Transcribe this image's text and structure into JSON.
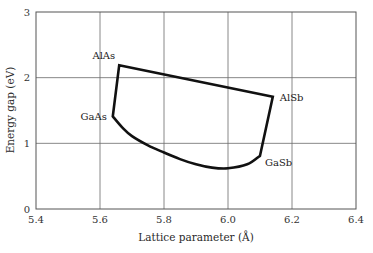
{
  "chart_data": {
    "type": "line",
    "title": "",
    "xlabel": "Lattice parameter (Å)",
    "ylabel": "Energy gap (eV)",
    "xlim": [
      5.4,
      6.4
    ],
    "ylim": [
      0,
      3
    ],
    "grid": true,
    "x_ticks": [
      5.4,
      5.6,
      5.8,
      6.0,
      6.2,
      6.4
    ],
    "x_tick_labels": [
      "5.4",
      "5.6",
      "5.8",
      "6.0",
      "6.2",
      "6.4"
    ],
    "y_ticks": [
      0,
      1,
      2,
      3
    ],
    "y_tick_labels": [
      "0",
      "1",
      "2",
      "3"
    ],
    "points": [
      {
        "name": "AlAs",
        "x": 5.66,
        "y": 2.19,
        "label_dx": -4,
        "label_dy": -6,
        "anchor": "end"
      },
      {
        "name": "AlSb",
        "x": 6.14,
        "y": 1.71,
        "label_dx": 7,
        "label_dy": 4,
        "anchor": "start"
      },
      {
        "name": "GaSb",
        "x": 6.1,
        "y": 0.81,
        "label_dx": 5,
        "label_dy": 10,
        "anchor": "start"
      },
      {
        "name": "GaAs",
        "x": 5.64,
        "y": 1.41,
        "label_dx": -6,
        "label_dy": 4,
        "anchor": "end"
      }
    ],
    "series": [
      {
        "name": "AlAs-AlSb",
        "type": "line",
        "x": [
          5.66,
          6.14
        ],
        "y": [
          2.19,
          1.71
        ]
      },
      {
        "name": "AlSb-GaSb",
        "type": "line",
        "x": [
          6.14,
          6.1
        ],
        "y": [
          1.71,
          0.81
        ]
      },
      {
        "name": "GaSb-GaAs",
        "type": "curve",
        "x": [
          6.1,
          6.06,
          6.0,
          5.95,
          5.9,
          5.85,
          5.8,
          5.75,
          5.7,
          5.67,
          5.64
        ],
        "y": [
          0.81,
          0.68,
          0.62,
          0.63,
          0.68,
          0.76,
          0.86,
          0.97,
          1.11,
          1.24,
          1.41
        ]
      },
      {
        "name": "GaAs-AlAs",
        "type": "line",
        "x": [
          5.64,
          5.66
        ],
        "y": [
          1.41,
          2.19
        ]
      }
    ]
  },
  "labels": {
    "xlabel": "Lattice parameter (Å)",
    "ylabel": "Energy gap (eV)"
  },
  "layout": {
    "plot_left": 36,
    "plot_right": 356,
    "plot_top": 12,
    "plot_bottom": 209
  }
}
